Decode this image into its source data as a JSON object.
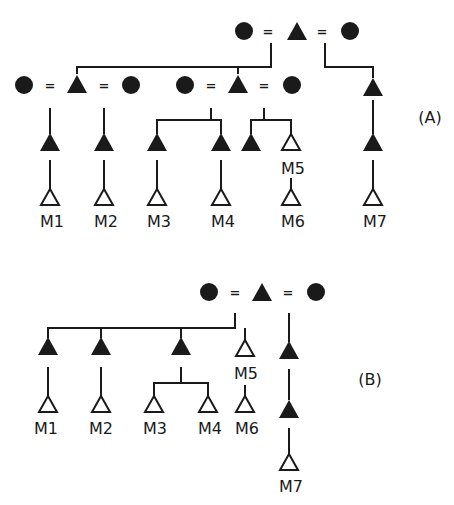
{
  "figure": {
    "type": "kinship-diagram",
    "colors": {
      "ink": "#1a1a1a",
      "background": "#ffffff"
    },
    "legend": {
      "filled_circle": "female",
      "filled_triangle": "male (ancestor)",
      "open_triangle": "male (marked individual)",
      "equals": "marriage"
    }
  },
  "panels": [
    {
      "id": "A",
      "label": "(A)",
      "marriage_sign": "=",
      "individuals": [
        {
          "id": "M1",
          "label": "M1"
        },
        {
          "id": "M2",
          "label": "M2"
        },
        {
          "id": "M3",
          "label": "M3"
        },
        {
          "id": "M4",
          "label": "M4"
        },
        {
          "id": "M5",
          "label": "M5"
        },
        {
          "id": "M6",
          "label": "M6"
        },
        {
          "id": "M7",
          "label": "M7"
        }
      ]
    },
    {
      "id": "B",
      "label": "(B)",
      "marriage_sign": "=",
      "individuals": [
        {
          "id": "M1",
          "label": "M1"
        },
        {
          "id": "M2",
          "label": "M2"
        },
        {
          "id": "M3",
          "label": "M3"
        },
        {
          "id": "M4",
          "label": "M4"
        },
        {
          "id": "M5",
          "label": "M5"
        },
        {
          "id": "M6",
          "label": "M6"
        },
        {
          "id": "M7",
          "label": "M7"
        }
      ]
    }
  ]
}
